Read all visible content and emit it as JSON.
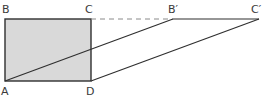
{
  "diagram": {
    "type": "geometry-shear",
    "colors": {
      "stroke": "#2f2f2f",
      "fill": "#d9d9d9",
      "dashed": "#8a8a8a",
      "label": "#3a3a3a"
    },
    "points": {
      "A": {
        "label": "A",
        "x": 5,
        "y": 81
      },
      "B": {
        "label": "B",
        "x": 5,
        "y": 19
      },
      "C": {
        "label": "C",
        "x": 91,
        "y": 19
      },
      "D": {
        "label": "D",
        "x": 91,
        "y": 81
      },
      "B_prime": {
        "label": "B′",
        "x": 173,
        "y": 19
      },
      "C_prime": {
        "label": "C′",
        "x": 259,
        "y": 19
      }
    },
    "shapes": {
      "rectangle": {
        "name": "ABCD",
        "filled": true
      },
      "parallelogram": {
        "name": "AB′C′D",
        "filled": false
      },
      "dashed_extension": {
        "from": "C",
        "to": "B′"
      }
    }
  }
}
